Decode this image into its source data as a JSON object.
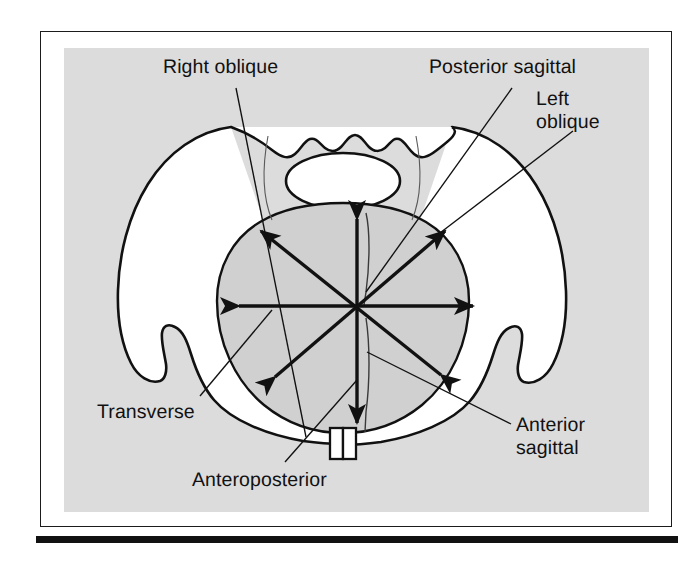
{
  "figure": {
    "type": "anatomical-diagram",
    "panel_background": "#dcdcdc",
    "frame_border_color": "#1b1b1b",
    "ink_color": "#111111",
    "labels": [
      {
        "id": "right-oblique",
        "text": "Right oblique"
      },
      {
        "id": "posterior-sagittal",
        "text": "Posterior sagittal"
      },
      {
        "id": "left-oblique",
        "text": "Left\noblique"
      },
      {
        "id": "transverse",
        "text": "Transverse"
      },
      {
        "id": "anteroposterior",
        "text": "Anteroposterior"
      },
      {
        "id": "anterior-sagittal",
        "text": "Anterior\nsagittal"
      }
    ],
    "diameters": [
      {
        "name": "Anteroposterior",
        "orientation": "vertical",
        "arrowheads": "both"
      },
      {
        "name": "Transverse",
        "orientation": "horizontal",
        "arrowheads": "both"
      },
      {
        "name": "Right oblique",
        "orientation": "diagonal-nw-se",
        "arrowheads": "both"
      },
      {
        "name": "Left oblique",
        "orientation": "diagonal-ne-sw",
        "arrowheads": "both"
      },
      {
        "name": "Posterior sagittal",
        "orientation": "vertical-posterior-half",
        "arrowheads": "none"
      },
      {
        "name": "Anterior sagittal",
        "orientation": "vertical-anterior-half",
        "arrowheads": "none"
      }
    ]
  }
}
